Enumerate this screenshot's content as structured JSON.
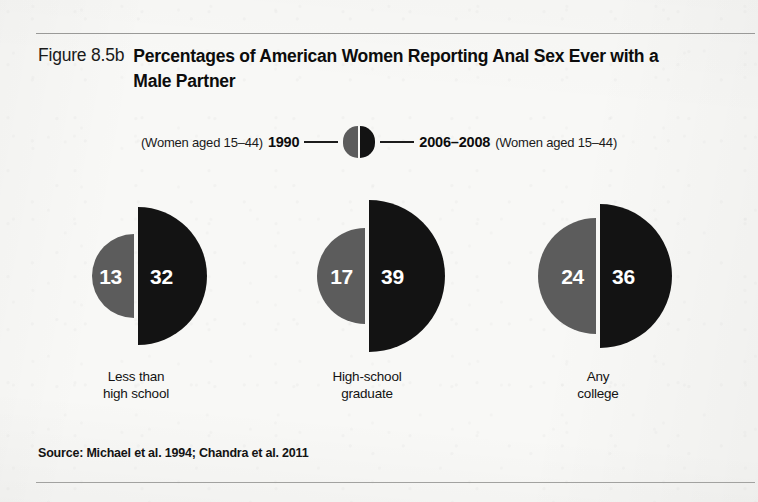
{
  "figure": {
    "number": "Figure 8.5b",
    "title": "Percentages of American Women Reporting Anal Sex Ever with a Male Partner",
    "source": "Source: Michael et al. 1994; Chandra et al. 2011"
  },
  "legend": {
    "left_note": "(Women aged 15–44)",
    "left_year": "1990",
    "right_year": "2006–2008",
    "right_note": "(Women aged 15–44)",
    "icon": "split-circle-icon"
  },
  "colors": {
    "series_1990": "#5c5c5c",
    "series_2006_2008": "#131313",
    "value_text": "#ffffff",
    "page_background": "#f8f8f6",
    "rule": "#9a9a98"
  },
  "chart_data": {
    "type": "bar",
    "title": "Percentages of American Women Reporting Anal Sex Ever with a Male Partner",
    "xlabel": "",
    "ylabel": "Percent reporting anal sex ever",
    "units": "percent",
    "encoding": "paired semicircles, radius proportional to square root of value (area-proportional)",
    "categories": [
      "Less than high school",
      "High-school graduate",
      "Any college"
    ],
    "category_lines": [
      [
        "Less than",
        "high school"
      ],
      [
        "High-school",
        "graduate"
      ],
      [
        "Any",
        "college"
      ]
    ],
    "series": [
      {
        "name": "1990",
        "note": "(Women aged 15–44)",
        "color": "#5c5c5c",
        "side": "left",
        "values": [
          13,
          17,
          24
        ]
      },
      {
        "name": "2006–2008",
        "note": "(Women aged 15–44)",
        "color": "#131313",
        "side": "right",
        "values": [
          32,
          39,
          36
        ]
      }
    ],
    "groups": [
      {
        "category": "Less than high school",
        "left_value": 13,
        "right_value": 32,
        "left_radius": 42,
        "right_radius": 69,
        "center_x": 136
      },
      {
        "category": "High-school graduate",
        "left_value": 17,
        "right_value": 39,
        "left_radius": 48,
        "right_radius": 76,
        "center_x": 367
      },
      {
        "category": "Any college",
        "left_value": 24,
        "right_value": 36,
        "left_radius": 58,
        "right_radius": 72,
        "center_x": 598
      }
    ],
    "ylim": [
      0,
      40
    ],
    "grid": false,
    "legend_position": "top-center"
  }
}
